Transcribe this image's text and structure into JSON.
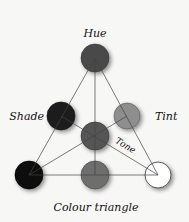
{
  "diagram": {
    "title": "Colour triangle",
    "labels": {
      "hue": "Hue",
      "shade": "Shade",
      "tint": "Tint",
      "tone": "Tone"
    },
    "nodes": [
      {
        "id": "hue",
        "color": "#4a4a4a"
      },
      {
        "id": "shade",
        "color": "#222222"
      },
      {
        "id": "tint",
        "color": "#8c8c8c"
      },
      {
        "id": "tone",
        "color": "#555555"
      },
      {
        "id": "black",
        "color": "#0a0a0a"
      },
      {
        "id": "grey",
        "color": "#6e6e6e"
      },
      {
        "id": "white",
        "color": "#ffffff"
      }
    ]
  }
}
